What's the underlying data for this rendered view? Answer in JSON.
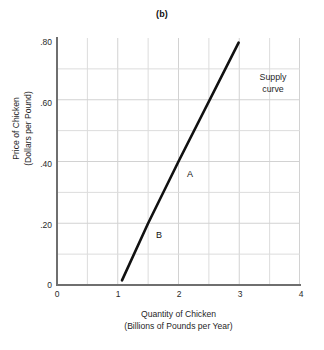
{
  "chart_data": {
    "type": "line",
    "title": "(b)",
    "xlabel": "Quantity of Chicken\n(Billions of Pounds per Year)",
    "xlabel_line1": "Quantity of Chicken",
    "xlabel_line2": "(Billions of Pounds per Year)",
    "ylabel": "Price of Chicken\n(Dollars per Pound)",
    "ylabel_line1": "Price of Chicken",
    "ylabel_line2": "(Dollars per Pound)",
    "xlim": [
      0,
      4
    ],
    "ylim": [
      0,
      0.8
    ],
    "xticks": [
      0,
      1,
      2,
      3,
      4
    ],
    "xtick_labels": [
      "0",
      "1",
      "2",
      "3",
      "4"
    ],
    "yticks": [
      0,
      0.2,
      0.4,
      0.6,
      0.8
    ],
    "ytick_labels": [
      "0",
      ".20",
      ".40",
      ".60",
      ".80"
    ],
    "grid": true,
    "grid_x_step": 0.5,
    "grid_y_step": 0.1,
    "grid_color": "#d9d9d9",
    "axis_color": "#6f6f6f",
    "legend": "none",
    "series": [
      {
        "name": "Supply curve",
        "color": "#111111",
        "line_width": 2.6,
        "x": [
          1.07,
          1.5,
          2.0,
          2.99
        ],
        "y": [
          0.015,
          0.2,
          0.4,
          0.785
        ]
      }
    ],
    "annotations": [
      {
        "name": "supply-curve-label",
        "text_line1": "Supply",
        "text_line2": "curve",
        "x": 3.35,
        "y": 0.655
      },
      {
        "name": "point-label-a",
        "text": "A",
        "x": 2.14,
        "y": 0.375
      },
      {
        "name": "point-label-b",
        "text": "B",
        "x": 1.64,
        "y": 0.175
      }
    ],
    "points": [
      {
        "label": "A",
        "x": 2.0,
        "y": 0.4
      },
      {
        "label": "B",
        "x": 1.5,
        "y": 0.2
      }
    ]
  }
}
